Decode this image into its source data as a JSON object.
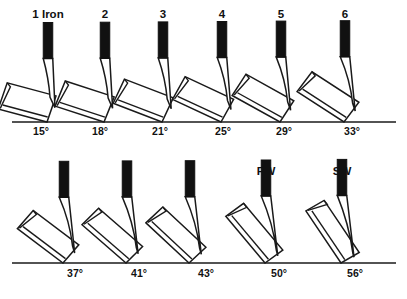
{
  "figure": {
    "ground_color": "#1a1a1a",
    "shaft_color": "#111111",
    "head_fill": "#ffffff",
    "head_stroke": "#1a1a1a",
    "degree_symbol": "°",
    "width": 407,
    "height": 299
  },
  "chart_data": {
    "type": "diagram",
    "xlabel": "",
    "ylabel": "",
    "categories": [
      "1 Iron",
      "2",
      "3",
      "4",
      "5",
      "6",
      "7",
      "8",
      "9",
      "PW",
      "SW"
    ],
    "values": [
      15,
      18,
      21,
      25,
      29,
      33,
      37,
      41,
      43,
      50,
      56
    ],
    "units": "degrees",
    "legend": []
  },
  "rows": [
    {
      "name": "long-irons-row",
      "ground_y": 122,
      "ground_x1": 12,
      "ground_x2": 396,
      "label_y": 18,
      "loft_label_y": 135,
      "clubs": [
        {
          "id": "club-1-iron",
          "label": "1 Iron",
          "loft": 15,
          "loft_label": "15°",
          "shaft_x": 48,
          "label_x": 48,
          "loft_label_x": 41
        },
        {
          "id": "club-2-iron",
          "label": "2",
          "loft": 18,
          "loft_label": "18°",
          "shaft_x": 105,
          "label_x": 105,
          "loft_label_x": 100
        },
        {
          "id": "club-3-iron",
          "label": "3",
          "loft": 21,
          "loft_label": "21°",
          "shaft_x": 163,
          "label_x": 163,
          "loft_label_x": 160
        },
        {
          "id": "club-4-iron",
          "label": "4",
          "loft": 25,
          "loft_label": "25°",
          "shaft_x": 222,
          "label_x": 222,
          "loft_label_x": 223
        },
        {
          "id": "club-5-iron",
          "label": "5",
          "loft": 29,
          "loft_label": "29°",
          "shaft_x": 281,
          "label_x": 281,
          "loft_label_x": 284
        },
        {
          "id": "club-6-iron",
          "label": "6",
          "loft": 33,
          "loft_label": "33°",
          "shaft_x": 345,
          "label_x": 345,
          "loft_label_x": 352
        }
      ]
    },
    {
      "name": "short-irons-row",
      "ground_y": 263,
      "ground_x1": 12,
      "ground_x2": 396,
      "label_y": 175,
      "loft_label_y": 277,
      "clubs": [
        {
          "id": "club-7-iron",
          "label": "7",
          "loft": 37,
          "loft_label": "37°",
          "shaft_x": 64,
          "label_x": 64,
          "loft_label_x": 75
        },
        {
          "id": "club-8-iron",
          "label": "8",
          "loft": 41,
          "loft_label": "41°",
          "shaft_x": 127,
          "label_x": 127,
          "loft_label_x": 139
        },
        {
          "id": "club-9-iron",
          "label": "9",
          "loft": 43,
          "loft_label": "43°",
          "shaft_x": 190,
          "label_x": 190,
          "loft_label_x": 206
        },
        {
          "id": "club-pw",
          "label": "PW",
          "loft": 50,
          "loft_label": "50°",
          "shaft_x": 266,
          "label_x": 266,
          "loft_label_x": 279
        },
        {
          "id": "club-sw",
          "label": "SW",
          "loft": 56,
          "loft_label": "56°",
          "shaft_x": 342,
          "label_x": 342,
          "loft_label_x": 355
        }
      ]
    }
  ]
}
